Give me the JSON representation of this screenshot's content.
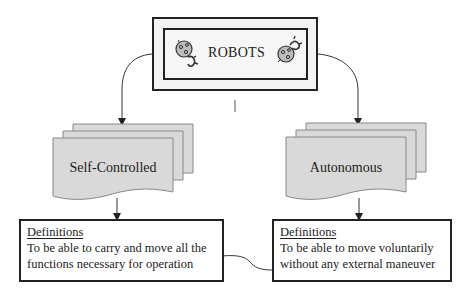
{
  "root": {
    "title": "ROBOTS",
    "icons": [
      "robot-icon",
      "robot-icon"
    ]
  },
  "branches": [
    {
      "label": "Self-Controlled",
      "definition": {
        "heading": "Definitions",
        "line1": "To be able to carry and move all the",
        "line2": "functions necessary for operation"
      }
    },
    {
      "label": "Autonomous",
      "definition": {
        "heading": "Definitions",
        "line1": "To be able to move voluntarily",
        "line2": "without any external maneuver"
      }
    }
  ],
  "colors": {
    "line": "#222222",
    "doc_fill": "#d9d9d9",
    "doc_stroke": "#777777",
    "root_fill": "#f3f3f3"
  }
}
